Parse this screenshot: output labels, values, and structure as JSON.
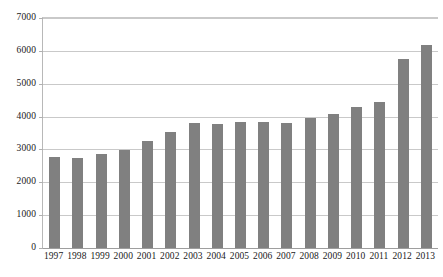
{
  "chart_data": {
    "type": "bar",
    "title": "",
    "subtitle": "",
    "xlabel": "",
    "ylabel": "",
    "categories": [
      "1997",
      "1998",
      "1999",
      "2000",
      "2001",
      "2002",
      "2003",
      "2004",
      "2005",
      "2006",
      "2007",
      "2008",
      "2009",
      "2010",
      "2011",
      "2012",
      "2013"
    ],
    "values": [
      2780,
      2730,
      2860,
      2980,
      3260,
      3540,
      3800,
      3780,
      3830,
      3850,
      3810,
      3950,
      4080,
      4300,
      4440,
      5750,
      6180
    ],
    "series": [
      {
        "name": "",
        "values": [
          2780,
          2730,
          2860,
          2980,
          3260,
          3540,
          3800,
          3780,
          3830,
          3850,
          3810,
          3950,
          4080,
          4300,
          4440,
          5750,
          6180
        ]
      }
    ],
    "ylim": [
      0,
      7000
    ],
    "y_ticks": [
      0,
      1000,
      2000,
      3000,
      4000,
      5000,
      6000,
      7000
    ],
    "y_tick_labels": [
      "0",
      "1000",
      "2000",
      "3000",
      "4000",
      "5000",
      "6000",
      "7000"
    ],
    "grid": true,
    "grid_axis": "y",
    "legend": false,
    "legend_position": "none",
    "annotations": [],
    "colors": {
      "bar": "#808080",
      "gridline": "#c9c9c9",
      "axis": "#b0b0b0",
      "text": "#1a1a1a",
      "background": "#ffffff"
    }
  }
}
